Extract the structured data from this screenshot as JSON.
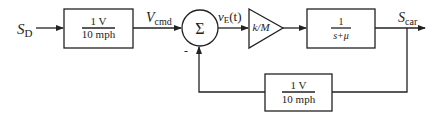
{
  "diagram": {
    "type": "block-diagram",
    "input_signal": {
      "base": "S",
      "sub": "D"
    },
    "blocks": [
      {
        "id": "command-gain",
        "numerator": "1 V",
        "denominator": "10 mph"
      },
      {
        "id": "summing-junction",
        "symbol": "Σ",
        "minus_sign": "-"
      },
      {
        "id": "amplifier-gain",
        "label": "k/M"
      },
      {
        "id": "plant",
        "numerator": "1",
        "denominator": "s+μ"
      },
      {
        "id": "feedback-gain",
        "numerator": "1 V",
        "denominator": "10 mph"
      }
    ],
    "signals": {
      "v_cmd": {
        "base": "V",
        "sub": "cmd"
      },
      "error": {
        "base": "v",
        "sub": "E",
        "suffix": "(t)"
      },
      "output": {
        "base": "S",
        "sub": "car"
      }
    }
  }
}
